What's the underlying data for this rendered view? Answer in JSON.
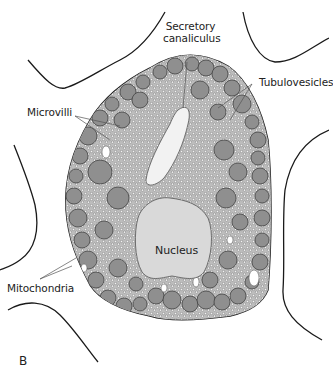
{
  "figure": {
    "panel_label": "B",
    "labels": {
      "secretory_canaliculus": [
        "Secretory",
        "canaliculus"
      ],
      "tubulovesicles": "Tubulovesicles",
      "microvilli": "Microvilli",
      "nucleus": "Nucleus",
      "mitochondria": "Mitochondria"
    },
    "colors": {
      "outline": "#1a1a1a",
      "cytoplasm": "#cfcfcf",
      "mitochondria": "#8f8f8f",
      "nucleus": "#d9d9d9",
      "canaliculus": "#f2f2f2",
      "background": "#ffffff"
    }
  }
}
